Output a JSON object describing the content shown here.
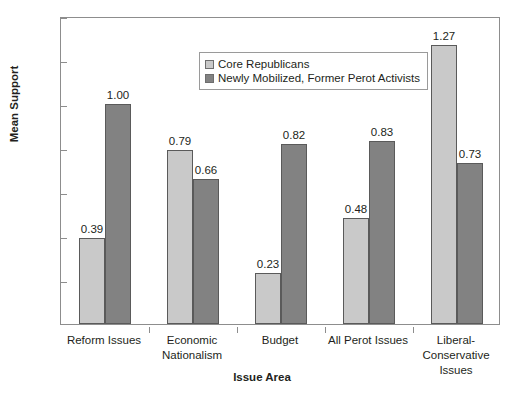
{
  "chart_data": {
    "type": "bar",
    "title": "",
    "xlabel": "Issue Area",
    "ylabel": "Mean Support",
    "ylim": [
      0,
      1.4
    ],
    "yticks": [
      "0",
      "0.2",
      "0.4",
      "0.6",
      "0.8",
      "1",
      "1.2",
      "1.4"
    ],
    "ytick_values": [
      0,
      0.2,
      0.4,
      0.6,
      0.8,
      1,
      1.2,
      1.4
    ],
    "grid": false,
    "legend_position": "upper-center",
    "categories": [
      "Reform Issues",
      "Economic Nationalism",
      "Budget",
      "All Perot Issues",
      "Liberal-Conservative Issues"
    ],
    "category_lines": [
      [
        "Reform Issues"
      ],
      [
        "Economic",
        "Nationalism"
      ],
      [
        "Budget"
      ],
      [
        "All Perot Issues"
      ],
      [
        "Liberal-",
        "Conservative",
        "Issues"
      ]
    ],
    "series": [
      {
        "name": "Core Republicans",
        "color": "#c9c9c9",
        "values": [
          0.39,
          0.79,
          0.23,
          0.48,
          1.27
        ],
        "labels": [
          "0.39",
          "0.79",
          "0.23",
          "0.48",
          "1.27"
        ]
      },
      {
        "name": "Newly Mobilized, Former Perot Activists",
        "color": "#828282",
        "values": [
          1.0,
          0.66,
          0.82,
          0.83,
          0.73
        ],
        "labels": [
          "1.00",
          "0.66",
          "0.82",
          "0.83",
          "0.73"
        ]
      }
    ]
  }
}
